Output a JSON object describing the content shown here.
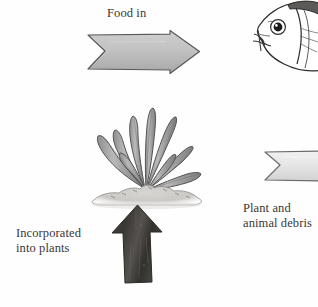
{
  "diagram": {
    "background_color": "#fefefe",
    "text_color": "#3a3632",
    "labels": {
      "food_in": "Food in",
      "incorporated_into_plants": "Incorporated\ninto plants",
      "plant_and_animal_debris": "Plant and\nanimal debris"
    },
    "figures": {
      "arrow_food_in": {
        "name": "food-in-arrow",
        "direction": "right",
        "style": "notched-tail chevron",
        "fill_color": "#c2c2c2",
        "stroke_color": "#5a5a5a"
      },
      "arrow_incorporated": {
        "name": "incorporated-arrow",
        "direction": "up",
        "style": "solid textured block arrow",
        "fill_color": "#3f3d3b",
        "stroke_color": "#2a2826"
      },
      "arrow_debris": {
        "name": "debris-arrow",
        "direction": "right",
        "style": "notched-tail chevron, cropped at right edge",
        "fill_color": "#e4e4e4",
        "stroke_color": "#6a6a6a"
      },
      "plant": {
        "name": "aquatic-plant",
        "description": "aquatic plant with long pointed leaves on gravel mound",
        "leaf_fill_color": "#a6a6a6",
        "leaf_stroke_color": "#4b4b4b",
        "gravel_color": "#cfcdc9"
      },
      "fish": {
        "name": "fish-head",
        "description": "fish head facing left, cropped at right edge",
        "body_fill_color": "#ffffff",
        "dorsal_color": "#5c5a58",
        "eye_color": "#1b1b1b",
        "outline_color": "#2e2e2e"
      }
    }
  }
}
